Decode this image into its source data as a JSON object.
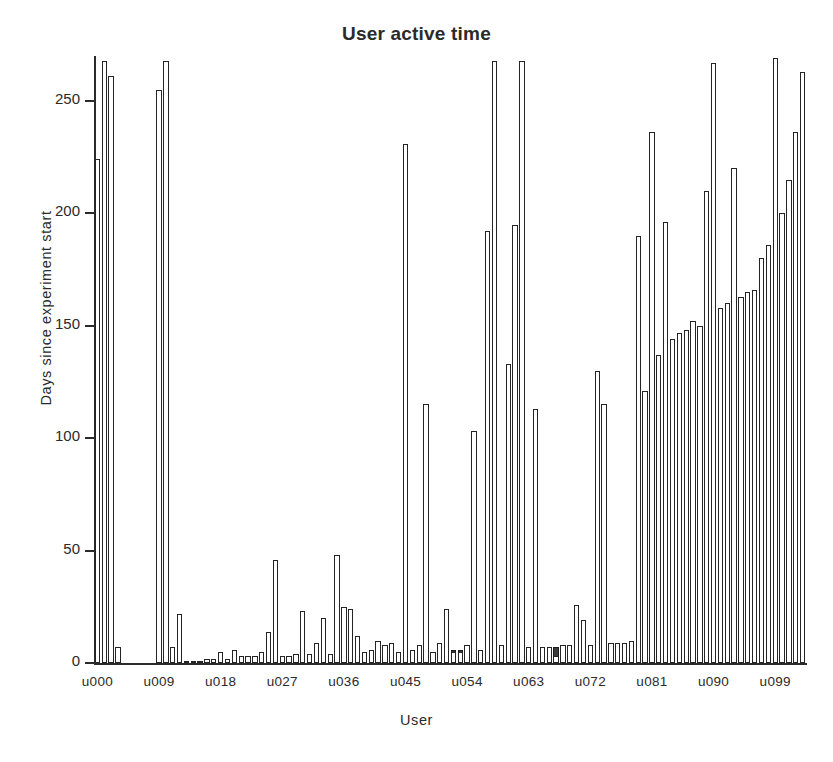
{
  "chart_data": {
    "type": "bar",
    "title": "User active time",
    "xlabel": "User",
    "ylabel": "Days since experiment start",
    "ylim": [
      0,
      270
    ],
    "yticks": [
      0,
      50,
      100,
      150,
      200,
      250
    ],
    "ytick_labels": [
      "0",
      "50",
      "100",
      "150",
      "200",
      "250"
    ],
    "grid": false,
    "legend": null,
    "xtick_labels": [
      "u000",
      "u009",
      "u018",
      "u027",
      "u036",
      "u045",
      "u054",
      "u063",
      "u072",
      "u081",
      "u090",
      "u099"
    ],
    "xtick_indices": [
      0,
      9,
      18,
      27,
      36,
      45,
      54,
      63,
      72,
      81,
      90,
      99
    ],
    "categories": [
      "u000",
      "u001",
      "u002",
      "u003",
      "u004",
      "u005",
      "u006",
      "u007",
      "u008",
      "u009",
      "u010",
      "u011",
      "u012",
      "u013",
      "u014",
      "u015",
      "u016",
      "u017",
      "u018",
      "u019",
      "u020",
      "u021",
      "u022",
      "u023",
      "u024",
      "u025",
      "u026",
      "u027",
      "u028",
      "u029",
      "u030",
      "u031",
      "u032",
      "u033",
      "u034",
      "u035",
      "u036",
      "u037",
      "u038",
      "u039",
      "u040",
      "u041",
      "u042",
      "u043",
      "u044",
      "u045",
      "u046",
      "u047",
      "u048",
      "u049",
      "u050",
      "u051",
      "u052",
      "u053",
      "u054",
      "u055",
      "u056",
      "u057",
      "u058",
      "u059",
      "u060",
      "u061",
      "u062",
      "u063",
      "u064",
      "u065",
      "u066",
      "u067",
      "u068",
      "u069",
      "u070",
      "u071",
      "u072",
      "u073",
      "u074",
      "u075",
      "u076",
      "u077",
      "u078",
      "u079",
      "u080",
      "u081",
      "u082",
      "u083",
      "u084",
      "u085",
      "u086",
      "u087",
      "u088",
      "u089",
      "u090",
      "u091",
      "u092",
      "u093",
      "u094",
      "u095",
      "u096",
      "u097",
      "u098",
      "u099",
      "u100",
      "u101",
      "u102",
      "u103"
    ],
    "series": [
      {
        "name": "total elapsed",
        "style": "filled-dark",
        "color": "#3a3a3a",
        "values": [
          224,
          0,
          0,
          0,
          0,
          0,
          0,
          0,
          0,
          0,
          95,
          0,
          0,
          1,
          1,
          1,
          2,
          2,
          2,
          2,
          2,
          2,
          2,
          3,
          3,
          3,
          3,
          3,
          3,
          3,
          4,
          4,
          4,
          4,
          4,
          4,
          25,
          4,
          5,
          5,
          5,
          5,
          5,
          5,
          5,
          5,
          5,
          5,
          5,
          5,
          6,
          6,
          6,
          6,
          6,
          41,
          6,
          6,
          6,
          6,
          133,
          18,
          7,
          7,
          7,
          7,
          7,
          7,
          8,
          8,
          8,
          8,
          8,
          8,
          9,
          9,
          9,
          9,
          10,
          86,
          121,
          133,
          137,
          141,
          144,
          147,
          148,
          150,
          150,
          152,
          155,
          158,
          160,
          161,
          163,
          165,
          166,
          180,
          186,
          190,
          200,
          215,
          236,
          263
        ]
      },
      {
        "name": "user active time",
        "style": "outlined-white",
        "color": "#ffffff",
        "values": [
          224,
          268,
          261,
          7,
          0,
          0,
          0,
          0,
          0,
          255,
          268,
          7,
          22,
          1,
          1,
          1,
          2,
          2,
          5,
          2,
          6,
          3,
          3,
          3,
          5,
          14,
          46,
          3,
          3,
          4,
          23,
          4,
          9,
          20,
          4,
          48,
          25,
          24,
          12,
          5,
          6,
          10,
          8,
          9,
          5,
          231,
          6,
          8,
          115,
          5,
          9,
          24,
          5,
          5,
          8,
          103,
          6,
          192,
          268,
          8,
          133,
          195,
          268,
          7,
          113,
          7,
          7,
          3,
          8,
          8,
          26,
          19,
          8,
          130,
          115,
          9,
          9,
          9,
          10,
          190,
          121,
          236,
          137,
          196,
          144,
          147,
          148,
          152,
          150,
          210,
          267,
          158,
          160,
          220,
          163,
          165,
          166,
          180,
          186,
          269,
          200,
          215,
          236,
          263
        ]
      }
    ]
  }
}
